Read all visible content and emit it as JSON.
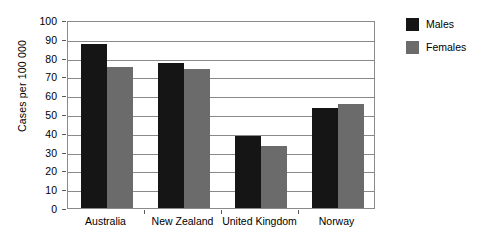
{
  "chart_data": {
    "type": "bar",
    "title": "",
    "xlabel": "",
    "ylabel": "Cases per 100 000",
    "ylim": [
      0,
      100
    ],
    "ytick_step": 10,
    "yticks": [
      0,
      10,
      20,
      30,
      40,
      50,
      60,
      70,
      80,
      90,
      100
    ],
    "grid": true,
    "grid_axis": "y",
    "legend_position": "top-right-outside",
    "categories": [
      "Australia",
      "New Zealand",
      "United Kingdom",
      "Norway"
    ],
    "series": [
      {
        "name": "Males",
        "color": "#151515",
        "values": [
          87,
          77,
          38.5,
          53
        ]
      },
      {
        "name": "Females",
        "color": "#6b6b6b",
        "values": [
          75,
          74,
          33,
          55.5
        ]
      }
    ]
  },
  "legend": {
    "items": [
      {
        "label": "Males",
        "color": "#151515"
      },
      {
        "label": "Females",
        "color": "#6b6b6b"
      }
    ]
  },
  "axis": {
    "y_title": "Cases per 100 000"
  },
  "colors": {
    "males": "#151515",
    "females": "#6b6b6b",
    "frame": "#8a8a8a",
    "background": "#ffffff"
  }
}
